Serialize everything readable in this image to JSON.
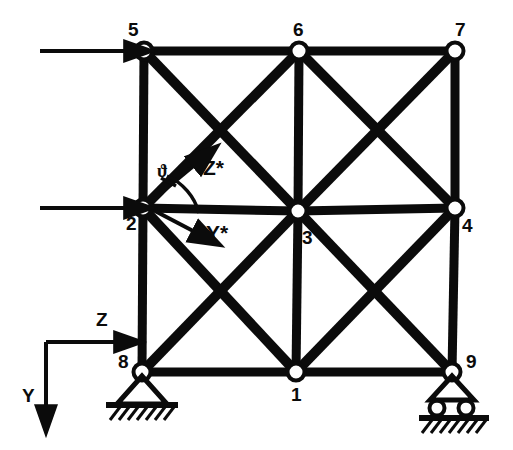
{
  "figure": {
    "kind": "plane-truss-structural-diagram",
    "ink_color": "#0b0b0b",
    "background_color": "#ffffff"
  },
  "nodes": [
    {
      "id": "1",
      "label": "1",
      "x": 296,
      "y": 372,
      "label_x": 291,
      "label_y": 385,
      "support": "none"
    },
    {
      "id": "2",
      "label": "2",
      "x": 143,
      "y": 208,
      "label_x": 126,
      "label_y": 214,
      "support": "none"
    },
    {
      "id": "3",
      "label": "3",
      "x": 298,
      "y": 211,
      "label_x": 302,
      "label_y": 228,
      "support": "none"
    },
    {
      "id": "4",
      "label": "4",
      "x": 455,
      "y": 208,
      "label_x": 462,
      "label_y": 216,
      "support": "none"
    },
    {
      "id": "5",
      "label": "5",
      "x": 144,
      "y": 51,
      "label_x": 128,
      "label_y": 20,
      "support": "none"
    },
    {
      "id": "6",
      "label": "6",
      "x": 299,
      "y": 51,
      "label_x": 293,
      "label_y": 20,
      "support": "none"
    },
    {
      "id": "7",
      "label": "7",
      "x": 455,
      "y": 51,
      "label_x": 455,
      "label_y": 20,
      "support": "none"
    },
    {
      "id": "8",
      "label": "8",
      "x": 142,
      "y": 372,
      "label_x": 118,
      "label_y": 352,
      "support": "pinned"
    },
    {
      "id": "9",
      "label": "9",
      "x": 452,
      "y": 372,
      "label_x": 466,
      "label_y": 352,
      "support": "roller"
    }
  ],
  "members": [
    {
      "from": "5",
      "to": "6",
      "type": "chord"
    },
    {
      "from": "6",
      "to": "7",
      "type": "chord"
    },
    {
      "from": "2",
      "to": "3",
      "type": "chord"
    },
    {
      "from": "3",
      "to": "4",
      "type": "chord"
    },
    {
      "from": "8",
      "to": "1",
      "type": "chord"
    },
    {
      "from": "1",
      "to": "9",
      "type": "chord"
    },
    {
      "from": "5",
      "to": "2",
      "type": "post"
    },
    {
      "from": "2",
      "to": "8",
      "type": "post"
    },
    {
      "from": "6",
      "to": "3",
      "type": "post"
    },
    {
      "from": "3",
      "to": "1",
      "type": "post"
    },
    {
      "from": "7",
      "to": "4",
      "type": "post"
    },
    {
      "from": "4",
      "to": "9",
      "type": "post"
    },
    {
      "from": "5",
      "to": "3",
      "type": "diagonal"
    },
    {
      "from": "2",
      "to": "6",
      "type": "diagonal"
    },
    {
      "from": "6",
      "to": "4",
      "type": "diagonal"
    },
    {
      "from": "3",
      "to": "7",
      "type": "diagonal"
    },
    {
      "from": "2",
      "to": "1",
      "type": "diagonal"
    },
    {
      "from": "8",
      "to": "3",
      "type": "diagonal"
    },
    {
      "from": "3",
      "to": "9",
      "type": "diagonal"
    },
    {
      "from": "1",
      "to": "4",
      "type": "diagonal"
    }
  ],
  "loads": [
    {
      "name": "top-load-arrow",
      "at_node": "5",
      "direction": "right",
      "x1": 40,
      "y1": 51,
      "x2": 131,
      "y2": 51
    },
    {
      "name": "mid-load-arrow",
      "at_node": "2",
      "direction": "right",
      "x1": 40,
      "y1": 208,
      "x2": 131,
      "y2": 208
    }
  ],
  "global_axes": {
    "origin_x": 46,
    "origin_y": 342,
    "z": {
      "label": "Z",
      "label_x": 96,
      "label_y": 310,
      "tip_x": 121,
      "tip_y": 342
    },
    "y": {
      "label": "Y",
      "label_x": 22,
      "label_y": 386,
      "tip_x": 46,
      "tip_y": 412
    }
  },
  "local_axes": {
    "at_node": "2",
    "angle_symbol": "ϑ",
    "angle_symbol_x": 157,
    "angle_symbol_y": 162,
    "z_star": {
      "label": "Z*",
      "label_x": 203,
      "label_y": 157,
      "tip_x": 199,
      "tip_y": 160
    },
    "y_star": {
      "label": "Y*",
      "label_x": 206,
      "label_y": 222,
      "tip_x": 200,
      "tip_y": 236
    }
  }
}
